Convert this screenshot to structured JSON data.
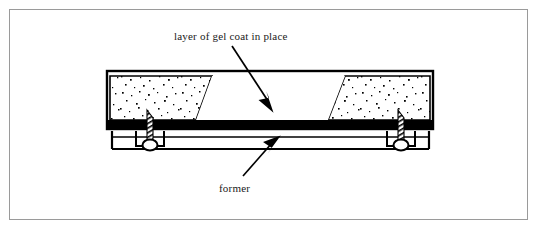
{
  "figure": {
    "width": 539,
    "height": 231,
    "background_color": "#ffffff",
    "border_color": "#9a9a9a",
    "ink_color": "#000000"
  },
  "labels": {
    "gel_coat": {
      "text": "layer of gel coat in place",
      "x": 174,
      "y": 30
    },
    "former": {
      "text": "former",
      "x": 219,
      "y": 182
    }
  },
  "leaders": {
    "gel_coat_arrow": {
      "name": "leader-arrow-gel-coat",
      "from_x": 232,
      "from_y": 46,
      "to_x": 273,
      "to_y": 108,
      "direction": "down-right",
      "head": "solid-triangle"
    },
    "former_arrow": {
      "name": "leader-arrow-former",
      "from_x": 245,
      "from_y": 174,
      "to_x": 277,
      "to_y": 139,
      "direction": "up-right",
      "head": "solid-triangle"
    }
  },
  "diagram": {
    "mould": {
      "name": "mould-body",
      "left": 106,
      "right": 434,
      "top": 70,
      "bottom": 130,
      "outline_width": 2,
      "fill": "#ffffff"
    },
    "gel_coat_band": {
      "name": "gel-coat-dark-band",
      "left": 106,
      "right": 434,
      "top": 120,
      "height": 8,
      "color": "#000000",
      "description": "solid dark horizontal layer of gel coat"
    },
    "stipple_regions": [
      {
        "name": "stipple-region-left",
        "description": "stippled/speckled laminate region at left of mould",
        "top_left_x": 110,
        "top_right_x": 212,
        "bottom_left_x": 110,
        "bottom_right_x": 196,
        "top": 76,
        "bottom": 120
      },
      {
        "name": "stipple-region-right",
        "description": "stippled/speckled laminate region at right of mould",
        "top_left_x": 345,
        "top_right_x": 430,
        "bottom_left_x": 328,
        "bottom_right_x": 430,
        "top": 76,
        "bottom": 120
      }
    ],
    "open_cavity": {
      "name": "gel-coat-cavity",
      "description": "white open area between the two stippled regions where the gel coat is in place",
      "top_left_x": 212,
      "top_right_x": 345,
      "bottom_left_x": 196,
      "bottom_right_x": 328
    },
    "former_frame": {
      "name": "former-frame",
      "description": "thin rectangular former frame supporting the mould from below",
      "left": 111,
      "right": 430,
      "top": 131,
      "bottom": 150,
      "line_width": 2
    },
    "fasteners": [
      {
        "name": "fastener-left",
        "description": "screw / bolt clamping mould to former at left",
        "x": 150,
        "head_y": 146,
        "shank_top_y": 113,
        "shank_bottom_y": 143
      },
      {
        "name": "fastener-right",
        "description": "screw / bolt clamping mould to former at right",
        "x": 401,
        "head_y": 146,
        "shank_top_y": 113,
        "shank_bottom_y": 143
      }
    ]
  }
}
